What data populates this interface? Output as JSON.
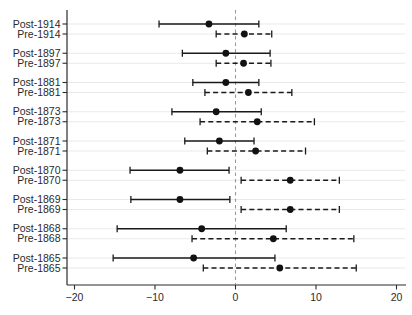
{
  "chart_data": {
    "type": "scatter",
    "subtype": "coefficient-forest-plot",
    "title": "",
    "xlabel": "",
    "ylabel": "",
    "xlim": [
      -21,
      21.2
    ],
    "x_ticks": [
      -20,
      -10,
      0,
      10,
      20
    ],
    "x_tick_labels": [
      "−20",
      "−10",
      "0",
      "10",
      "20"
    ],
    "grid": "horizontal-light",
    "legend": "none",
    "zero_reference_line": 0,
    "rows": [
      {
        "label": "Post-1914",
        "estimate": -3.3,
        "ci_low": -9.5,
        "ci_high": 2.9,
        "line_style": "solid"
      },
      {
        "label": "Pre-1914",
        "estimate": 1.1,
        "ci_low": -2.4,
        "ci_high": 4.5,
        "line_style": "dashed"
      },
      {
        "label": "Post-1897",
        "estimate": -1.2,
        "ci_low": -6.6,
        "ci_high": 4.3,
        "line_style": "solid"
      },
      {
        "label": "Pre-1897",
        "estimate": 1.0,
        "ci_low": -2.4,
        "ci_high": 4.4,
        "line_style": "dashed"
      },
      {
        "label": "Post-1881",
        "estimate": -1.2,
        "ci_low": -5.3,
        "ci_high": 2.9,
        "line_style": "solid"
      },
      {
        "label": "Pre-1881",
        "estimate": 1.6,
        "ci_low": -3.8,
        "ci_high": 7.0,
        "line_style": "dashed"
      },
      {
        "label": "Post-1873",
        "estimate": -2.4,
        "ci_low": -7.9,
        "ci_high": 3.2,
        "line_style": "solid"
      },
      {
        "label": "Pre-1873",
        "estimate": 2.7,
        "ci_low": -4.4,
        "ci_high": 9.8,
        "line_style": "dashed"
      },
      {
        "label": "Post-1871",
        "estimate": -2.0,
        "ci_low": -6.3,
        "ci_high": 2.3,
        "line_style": "solid"
      },
      {
        "label": "Pre-1871",
        "estimate": 2.5,
        "ci_low": -3.5,
        "ci_high": 8.7,
        "line_style": "dashed"
      },
      {
        "label": "Post-1870",
        "estimate": -6.9,
        "ci_low": -13.1,
        "ci_high": -0.8,
        "line_style": "solid"
      },
      {
        "label": "Pre-1870",
        "estimate": 6.8,
        "ci_low": 0.7,
        "ci_high": 12.9,
        "line_style": "dashed"
      },
      {
        "label": "Post-1869",
        "estimate": -6.9,
        "ci_low": -13.0,
        "ci_high": -0.7,
        "line_style": "solid"
      },
      {
        "label": "Pre-1869",
        "estimate": 6.8,
        "ci_low": 0.7,
        "ci_high": 12.9,
        "line_style": "dashed"
      },
      {
        "label": "Post-1868",
        "estimate": -4.2,
        "ci_low": -14.7,
        "ci_high": 6.3,
        "line_style": "solid"
      },
      {
        "label": "Pre-1868",
        "estimate": 4.7,
        "ci_low": -5.4,
        "ci_high": 14.7,
        "line_style": "dashed"
      },
      {
        "label": "Post-1865",
        "estimate": -5.2,
        "ci_low": -15.2,
        "ci_high": 4.9,
        "line_style": "solid"
      },
      {
        "label": "Pre-1865",
        "estimate": 5.5,
        "ci_low": -4.0,
        "ci_high": 15.0,
        "line_style": "dashed"
      }
    ],
    "colors": {
      "marker": "#121212",
      "ci_line": "#1a1a1a",
      "grid_line": "#e9e9e9",
      "zero_line": "#9c9c9c",
      "axis": "#2b2b2b",
      "label_text": "#2a2a2a",
      "background": "#ffffff"
    }
  }
}
